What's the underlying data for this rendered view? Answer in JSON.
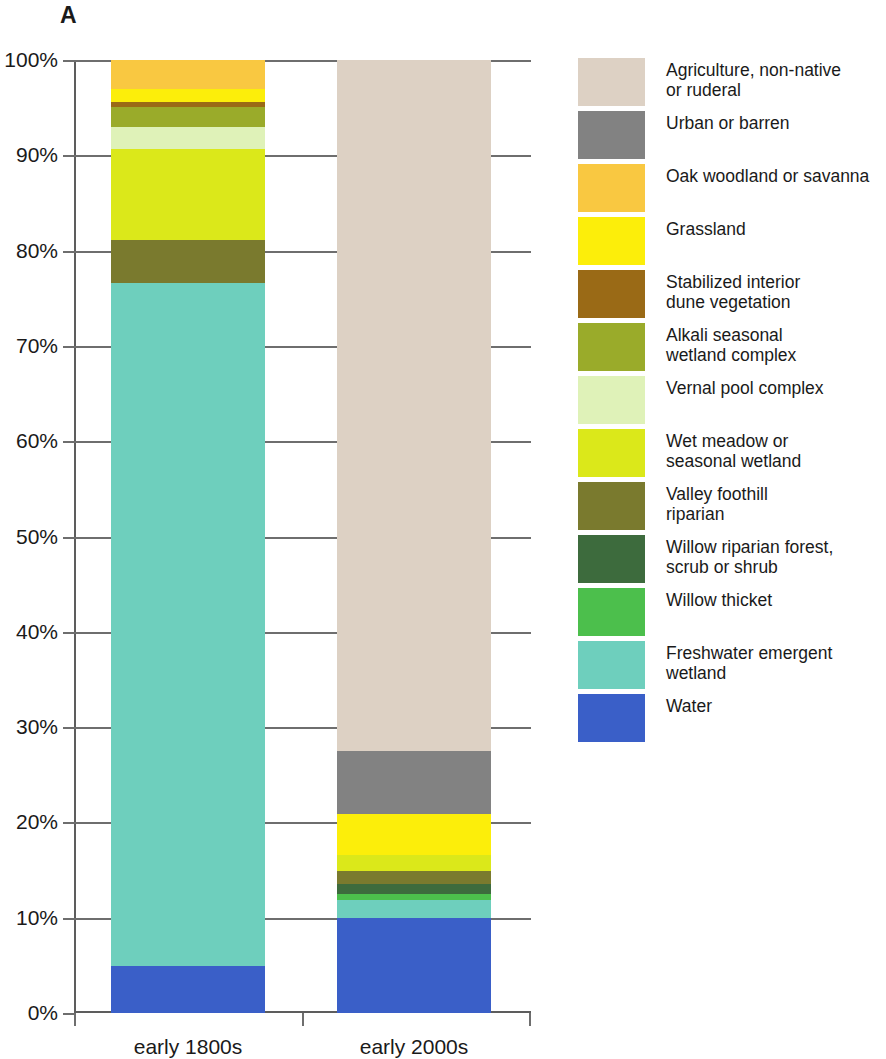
{
  "panel": {
    "letter": "A"
  },
  "chart_data": {
    "type": "bar",
    "subtype": "stacked-100-percent",
    "title": "",
    "xlabel": "",
    "ylabel": "",
    "ylim": [
      0,
      100
    ],
    "yticks": [
      "0%",
      "10%",
      "20%",
      "30%",
      "40%",
      "50%",
      "60%",
      "70%",
      "80%",
      "90%",
      "100%"
    ],
    "ytick_values": [
      0,
      10,
      20,
      30,
      40,
      50,
      60,
      70,
      80,
      90,
      100
    ],
    "grid": true,
    "legend_position": "right",
    "categories": [
      "early 1800s",
      "early 2000s"
    ],
    "series": [
      {
        "name": "Agriculture, non-native or ruderal",
        "color": "#ddd1c4",
        "values": [
          0.0,
          72.5
        ]
      },
      {
        "name": "Urban or barren",
        "color": "#828282",
        "values": [
          0.0,
          6.6
        ]
      },
      {
        "name": "Oak woodland or savanna",
        "color": "#f9c githubusercontent",
        "values": [
          0,
          0
        ]
      },
      {
        "name": "Grassland",
        "color": "#fcee0a",
        "values": [
          1.4,
          4.3
        ]
      },
      {
        "name": "Stabilized interior dune vegetation",
        "color": "#9a6a16",
        "values": [
          0.5,
          0.0
        ]
      },
      {
        "name": "Alkali seasonal wetland complex",
        "color": "#9aab2a",
        "values": [
          2.1,
          0.0
        ]
      },
      {
        "name": "Vernal pool complex",
        "color": "#dff2b8",
        "values": [
          2.3,
          0.0
        ]
      },
      {
        "name": "Wet meadow or seasonal wetland",
        "color": "#dbe81a",
        "values": [
          9.6,
          1.7
        ]
      },
      {
        "name": "Valley foothill riparian",
        "color": "#7a7a2e",
        "values": [
          4.5,
          1.4
        ]
      },
      {
        "name": "Willow riparian forest, scrub or shrub",
        "color": "#3d6b3d",
        "values": [
          0.0,
          1.0
        ]
      },
      {
        "name": "Willow thicket",
        "color": "#4cbf4c",
        "values": [
          0.0,
          0.6
        ]
      },
      {
        "name": "Freshwater emergent wetland",
        "color": "#6ecfbd",
        "values": [
          71.7,
          1.9
        ]
      },
      {
        "name": "Water",
        "color": "#3a5fc8",
        "values": [
          4.9,
          10.0
        ]
      }
    ],
    "stack_order_bottom_to_top": [
      "Water",
      "Freshwater emergent wetland",
      "Willow thicket",
      "Willow riparian forest, scrub or shrub",
      "Valley foothill riparian",
      "Wet meadow or seasonal wetland",
      "Vernal pool complex",
      "Alkali seasonal wetland complex",
      "Stabilized interior dune vegetation",
      "Grassland",
      "Oak woodland or savanna",
      "Urban or barren",
      "Agriculture, non-native or ruderal"
    ],
    "bars": [
      {
        "category": "early 1800s",
        "segments": [
          {
            "name": "Water",
            "color": "#3a5fc8",
            "value": 4.9
          },
          {
            "name": "Freshwater emergent wetland",
            "color": "#6ecfbd",
            "value": 71.7
          },
          {
            "name": "Valley foothill riparian",
            "color": "#7a7a2e",
            "value": 4.5
          },
          {
            "name": "Wet meadow or seasonal wetland",
            "color": "#dbe81a",
            "value": 9.6
          },
          {
            "name": "Vernal pool complex",
            "color": "#dff2b8",
            "value": 2.3
          },
          {
            "name": "Alkali seasonal wetland complex",
            "color": "#9aab2a",
            "value": 2.1
          },
          {
            "name": "Stabilized interior dune vegetation",
            "color": "#9a6a16",
            "value": 0.5
          },
          {
            "name": "Grassland",
            "color": "#fcee0a",
            "value": 1.4
          },
          {
            "name": "Oak woodland or savanna",
            "color": "#f9c841",
            "value": 3.0
          }
        ]
      },
      {
        "category": "early 2000s",
        "segments": [
          {
            "name": "Water",
            "color": "#3a5fc8",
            "value": 10.0
          },
          {
            "name": "Freshwater emergent wetland",
            "color": "#6ecfbd",
            "value": 1.9
          },
          {
            "name": "Willow thicket",
            "color": "#4cbf4c",
            "value": 0.6
          },
          {
            "name": "Willow riparian forest, scrub or shrub",
            "color": "#3d6b3d",
            "value": 1.0
          },
          {
            "name": "Valley foothill riparian",
            "color": "#7a7a2e",
            "value": 1.4
          },
          {
            "name": "Wet meadow or seasonal wetland",
            "color": "#dbe81a",
            "value": 1.7
          },
          {
            "name": "Grassland",
            "color": "#fcee0a",
            "value": 4.3
          },
          {
            "name": "Urban or barren",
            "color": "#828282",
            "value": 6.6
          },
          {
            "name": "Agriculture, non-native or ruderal",
            "color": "#ddd1c4",
            "value": 72.5
          }
        ]
      }
    ]
  },
  "legend": {
    "items": [
      {
        "label": "Agriculture, non-native\nor ruderal",
        "color": "#ddd1c4"
      },
      {
        "label": "Urban or barren",
        "color": "#828282"
      },
      {
        "label": "Oak woodland or savanna",
        "color": "#f9c841"
      },
      {
        "label": "Grassland",
        "color": "#fcee0a"
      },
      {
        "label": "Stabilized interior\ndune vegetation",
        "color": "#9a6a16"
      },
      {
        "label": "Alkali seasonal\nwetland complex",
        "color": "#9aab2a"
      },
      {
        "label": "Vernal pool complex",
        "color": "#dff2b8"
      },
      {
        "label": "Wet meadow or\nseasonal wetland",
        "color": "#dbe81a"
      },
      {
        "label": "Valley foothill\nriparian",
        "color": "#7a7a2e"
      },
      {
        "label": "Willow riparian forest,\nscrub or shrub",
        "color": "#3d6b3d"
      },
      {
        "label": "Willow thicket",
        "color": "#4cbf4c"
      },
      {
        "label": "Freshwater emergent\nwetland",
        "color": "#6ecfbd"
      },
      {
        "label": "Water",
        "color": "#3a5fc8"
      }
    ]
  }
}
